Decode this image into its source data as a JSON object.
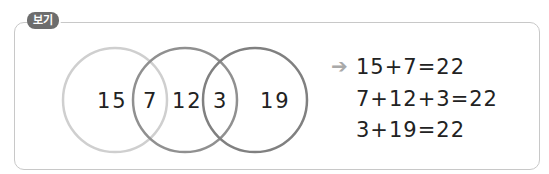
{
  "badge": {
    "label": "보기"
  },
  "venn": {
    "regions": [
      "15",
      "7",
      "12",
      "3",
      "19"
    ],
    "circle_colors": [
      "#c9c9c9",
      "#8c8c8c",
      "#7c7c7c"
    ]
  },
  "result": {
    "arrow_icon": "right-arrow-icon",
    "equations": [
      "15+7=22",
      "7+12+3=22",
      "3+19=22"
    ]
  }
}
